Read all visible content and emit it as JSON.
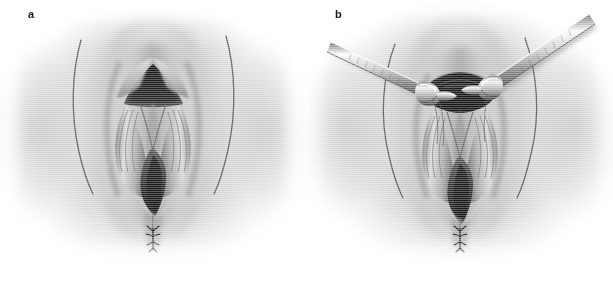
{
  "figure": {
    "kind": "medical-illustration",
    "orientation": "two-panel-horizontal",
    "background_color": "#ffffff",
    "ink_color": "#1a1a1a",
    "palette": {
      "paper": "#ffffff",
      "skin_light": "#e9e9e9",
      "skin_mid": "#b9b9b9",
      "skin_shadow": "#8c8c8c",
      "crease_line": "#4a4a4a",
      "introitus_dark": "#2b2b2b",
      "introitus_darkest": "#171717",
      "instrument_light": "#f2f2f2",
      "instrument_mid": "#b0b0b0",
      "instrument_dark": "#555555"
    },
    "panels": [
      {
        "id": "panel-a",
        "label": "a",
        "caption": "",
        "has_instruments": false,
        "instrument_count": 0
      },
      {
        "id": "panel-b",
        "label": "b",
        "caption": "",
        "has_instruments": true,
        "instrument_count": 2,
        "instrument_name": "clamp"
      }
    ]
  }
}
